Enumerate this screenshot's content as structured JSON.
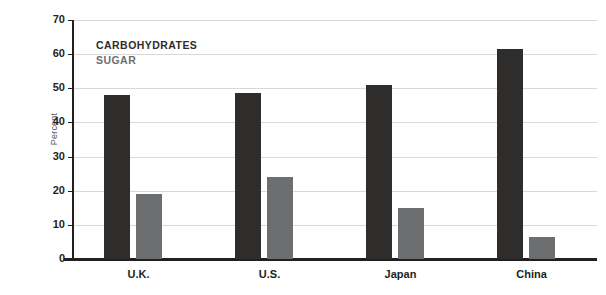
{
  "chart_data": {
    "type": "bar",
    "title": "",
    "subtitle": "",
    "xlabel": "",
    "ylabel": "Percent",
    "ylim": [
      0,
      70
    ],
    "ytick_step": 10,
    "yticks": [
      0,
      10,
      20,
      30,
      40,
      50,
      60,
      70
    ],
    "ytick_labels": [
      "0",
      "10",
      "20",
      "30",
      "40",
      "50",
      "60",
      "70"
    ],
    "grid": true,
    "grid_axis": "y",
    "legend_position": "inside-top-left",
    "categories": [
      "U.K.",
      "U.S.",
      "Japan",
      "China"
    ],
    "series": [
      {
        "name": "CARBOHYDRATES",
        "color": "#2e2d2c",
        "values": [
          48,
          48.5,
          51,
          61.5
        ]
      },
      {
        "name": "SUGAR",
        "color": "#6d6e70",
        "values": [
          19,
          24,
          15,
          6.5
        ]
      }
    ],
    "annotations": []
  },
  "axes": {
    "y_title": "Percent",
    "y_tick_labels": [
      "70",
      "60",
      "50",
      "40",
      "30",
      "20",
      "10",
      "0"
    ],
    "x_tick_labels": [
      "U.K.",
      "U.S.",
      "Japan",
      "China"
    ]
  },
  "legend": {
    "entries": [
      {
        "label": "CARBOHYDRATES",
        "color": "#2e2d2c"
      },
      {
        "label": "SUGAR",
        "color": "#6d6e70"
      }
    ]
  },
  "colors": {
    "carbohydrates": "#2e2d2c",
    "sugar": "#6d6e70",
    "grid": "#d8d8d8",
    "axis": "#231f20",
    "background": "#ffffff",
    "y_title": "#58595b"
  }
}
